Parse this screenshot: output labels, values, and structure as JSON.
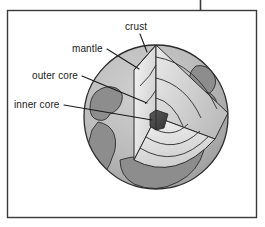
{
  "figure": {
    "frame": {
      "border_color": "#3a3a3a",
      "top_tick": "vertical-rule"
    },
    "background_color": "#ffffff"
  },
  "labels": [
    {
      "id": "crust",
      "text": "crust",
      "leader": "line-to-crust-layer"
    },
    {
      "id": "mantle",
      "text": "mantle",
      "leader": "line-to-mantle-layer"
    },
    {
      "id": "outer_core",
      "text": "outer core",
      "leader": "line-to-outer-core-layer"
    },
    {
      "id": "inner_core",
      "text": "inner core",
      "leader": "line-to-inner-core-layer"
    }
  ],
  "layers": [
    {
      "name": "crust",
      "fill": "#a8a8a8"
    },
    {
      "name": "mantle",
      "fill": "#c4c4c4"
    },
    {
      "name": "outer core",
      "fill": "#e2e2e2"
    },
    {
      "name": "inner core",
      "fill": "#4a4a4a"
    }
  ],
  "globe": {
    "sphere_fill": "#b4b4b4",
    "ocean_fill": "#bdbdbd",
    "land_fill": "#8f8f8f",
    "outline": "#2b2b2b",
    "center_x": 156,
    "center_y": 117,
    "radius": 72
  }
}
